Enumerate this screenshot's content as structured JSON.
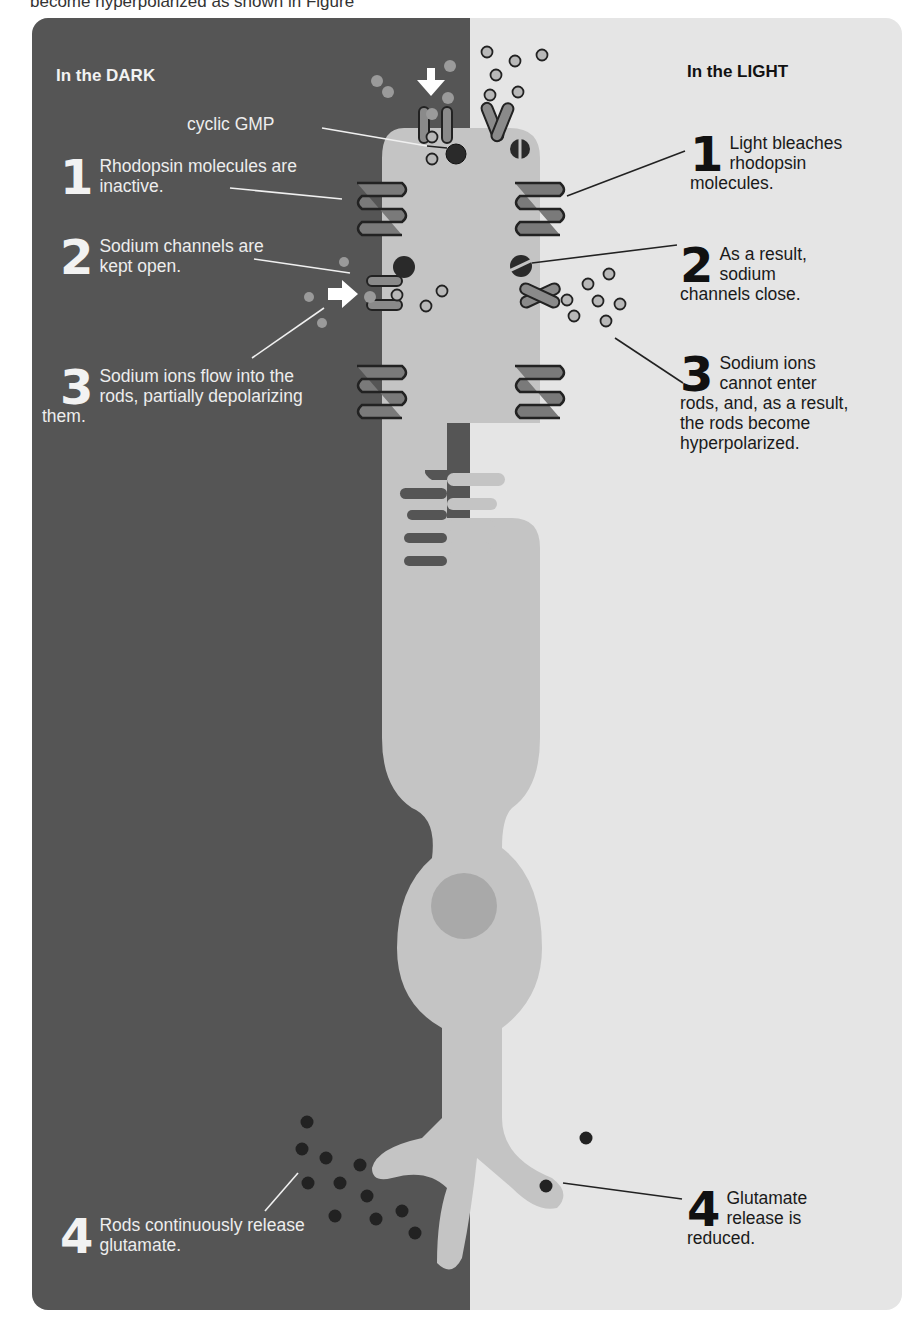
{
  "caption": "become hyperpolarized as shown in Figure",
  "panels": {
    "dark": {
      "title": "In the DARK",
      "bg": "#555555"
    },
    "light": {
      "title": "In the LIGHT",
      "bg": "#e5e5e5"
    }
  },
  "labels": {
    "cyclic_gmp": "cyclic GMP",
    "dark_steps": [
      {
        "num": "1",
        "text": "Rhodopsin molecules are inactive."
      },
      {
        "num": "2",
        "text": "Sodium channels are kept open."
      },
      {
        "num": "3",
        "text": "Sodium ions flow into the rods, partially depolarizing them."
      },
      {
        "num": "4",
        "text": "Rods continuously release glutamate."
      }
    ],
    "light_steps": [
      {
        "num": "1",
        "text": "Light bleaches rhodopsin molecules."
      },
      {
        "num": "2",
        "text": "As a result, sodium channels close."
      },
      {
        "num": "3",
        "text": "Sodium ions cannot enter rods, and, as a result, the rods become hyperpolarized."
      },
      {
        "num": "4",
        "text": "Glutamate release is reduced."
      }
    ]
  },
  "colors": {
    "cell_body": "#c4c4c4",
    "nucleus": "#a9a9a9",
    "membrane_disc": "#7a7a7a",
    "channel": "#8a8a8a",
    "ion": "#b0b0b0",
    "glutamate": "#222222",
    "cgmp": "#2a2a2a"
  }
}
